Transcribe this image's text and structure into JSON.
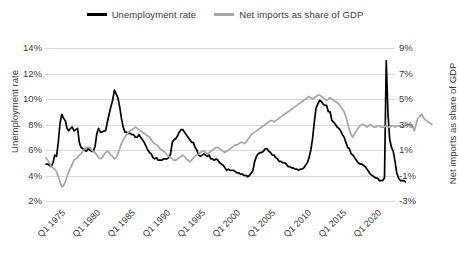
{
  "chart_data": {
    "type": "line",
    "title": "",
    "xlabel": "",
    "grid": true,
    "legend_position": "top-center",
    "axes": {
      "left": {
        "label": "Unemployment rate",
        "ticks": [
          "14%",
          "12%",
          "10%",
          "8%",
          "6%",
          "4%",
          "2%"
        ],
        "tick_values": [
          14,
          12,
          10,
          8,
          6,
          4,
          2
        ],
        "ylim": [
          2,
          14
        ]
      },
      "right": {
        "label": "Net imports as share of GDP",
        "ticks": [
          "9%",
          "7%",
          "5%",
          "3%",
          "1%",
          "-1%",
          "-3%"
        ],
        "tick_values": [
          9,
          7,
          5,
          3,
          1,
          -1,
          -3
        ],
        "ylim": [
          -3,
          9
        ]
      },
      "x": {
        "ticks": [
          "Q1 1975",
          "Q1 1980",
          "Q1 1985",
          "Q1 1990",
          "Q1 1995",
          "Q1 2000",
          "Q1 2005",
          "Q1 2010",
          "Q1 2015",
          "Q1 2020"
        ],
        "tick_years": [
          1975,
          1980,
          1985,
          1990,
          1995,
          2000,
          2005,
          2010,
          2015,
          2020
        ],
        "xlim": [
          1973.0,
          2022.75
        ]
      }
    },
    "legend": [
      {
        "name": "Unemployment rate",
        "color": "#000000",
        "axis": "left"
      },
      {
        "name": "Net imports as share of GDP",
        "color": "#a6a6a6",
        "axis": "right"
      }
    ],
    "series": [
      {
        "name": "Unemployment rate",
        "color": "#000000",
        "axis": "left",
        "width": 1.7,
        "x_start": 1973.0,
        "x_step": 0.25,
        "values": [
          4.9,
          4.9,
          4.8,
          4.7,
          5.0,
          5.6,
          5.5,
          6.6,
          8.1,
          8.8,
          8.5,
          8.3,
          7.7,
          7.5,
          7.7,
          7.8,
          7.5,
          7.6,
          7.7,
          6.6,
          6.2,
          6.1,
          6.0,
          5.9,
          6.1,
          6.0,
          5.9,
          5.9,
          6.3,
          7.3,
          7.7,
          7.4,
          7.4,
          7.5,
          7.5,
          8.2,
          8.8,
          9.4,
          9.9,
          10.7,
          10.4,
          10.1,
          9.4,
          8.5,
          7.8,
          7.4,
          7.4,
          7.3,
          7.3,
          7.2,
          7.2,
          7.0,
          7.0,
          7.2,
          7.0,
          6.8,
          6.6,
          6.3,
          6.0,
          5.8,
          5.7,
          5.4,
          5.3,
          5.4,
          5.2,
          5.2,
          5.2,
          5.3,
          5.3,
          5.3,
          5.4,
          5.7,
          6.6,
          6.8,
          6.9,
          7.1,
          7.4,
          7.6,
          7.6,
          7.4,
          7.2,
          7.0,
          6.8,
          6.6,
          6.6,
          6.2,
          6.0,
          5.6,
          5.5,
          5.6,
          5.7,
          5.6,
          5.5,
          5.6,
          5.3,
          5.3,
          5.2,
          5.3,
          5.2,
          5.0,
          4.9,
          4.8,
          4.6,
          4.4,
          4.5,
          4.4,
          4.4,
          4.4,
          4.3,
          4.2,
          4.2,
          4.1,
          4.1,
          4.0,
          4.0,
          3.9,
          4.0,
          4.2,
          4.4,
          5.1,
          5.5,
          5.7,
          5.8,
          5.8,
          5.9,
          6.1,
          6.1,
          5.9,
          5.8,
          5.6,
          5.6,
          5.4,
          5.3,
          5.1,
          5.1,
          5.0,
          5.0,
          4.9,
          4.7,
          4.7,
          4.6,
          4.6,
          4.5,
          4.5,
          4.4,
          4.5,
          4.5,
          4.6,
          4.8,
          5.0,
          5.4,
          6.0,
          6.9,
          8.2,
          9.3,
          9.6,
          9.9,
          9.8,
          9.6,
          9.5,
          9.5,
          9.0,
          9.0,
          8.3,
          8.2,
          8.0,
          7.8,
          7.7,
          7.5,
          7.2,
          7.0,
          6.6,
          6.2,
          6.1,
          5.7,
          5.6,
          5.4,
          5.2,
          5.0,
          4.9,
          4.9,
          4.8,
          4.7,
          4.5,
          4.3,
          4.1,
          4.0,
          3.9,
          3.8,
          3.8,
          3.6,
          3.6,
          3.6,
          3.8,
          13.0,
          8.8,
          6.8,
          6.2,
          5.9,
          5.1,
          4.2,
          3.8,
          3.6,
          3.6,
          3.6,
          3.5
        ]
      },
      {
        "name": "Net imports as share of GDP",
        "color": "#a6a6a6",
        "axis": "right",
        "width": 1.7,
        "x_start": 1973.0,
        "x_step": 0.25,
        "values": [
          0.4,
          0.2,
          0.0,
          -0.3,
          -0.4,
          -0.5,
          -0.7,
          -1.1,
          -1.5,
          -1.9,
          -1.8,
          -1.5,
          -1.1,
          -0.7,
          -0.4,
          -0.1,
          0.2,
          0.3,
          0.4,
          0.6,
          0.7,
          0.9,
          1.1,
          1.2,
          1.2,
          1.2,
          1.0,
          0.9,
          0.8,
          0.6,
          0.4,
          0.3,
          0.4,
          0.6,
          0.8,
          0.9,
          0.8,
          0.6,
          0.5,
          0.3,
          0.4,
          0.7,
          1.1,
          1.5,
          1.8,
          2.0,
          2.2,
          2.4,
          2.5,
          2.6,
          2.7,
          2.8,
          2.7,
          2.6,
          2.5,
          2.4,
          2.3,
          2.2,
          2.1,
          2.0,
          1.8,
          1.6,
          1.5,
          1.4,
          1.3,
          1.1,
          1.0,
          0.9,
          0.8,
          0.6,
          0.5,
          0.4,
          0.3,
          0.2,
          0.2,
          0.3,
          0.4,
          0.5,
          0.6,
          0.5,
          0.3,
          0.2,
          0.1,
          0.2,
          0.4,
          0.5,
          0.6,
          0.7,
          0.8,
          0.9,
          0.9,
          0.8,
          0.7,
          0.8,
          0.9,
          1.0,
          1.1,
          1.2,
          1.2,
          1.1,
          1.0,
          0.9,
          0.8,
          0.9,
          1.0,
          1.1,
          1.2,
          1.3,
          1.4,
          1.4,
          1.5,
          1.6,
          1.6,
          1.5,
          1.6,
          1.8,
          2.0,
          2.2,
          2.3,
          2.4,
          2.5,
          2.6,
          2.7,
          2.8,
          2.9,
          3.0,
          3.1,
          3.2,
          3.3,
          3.3,
          3.2,
          3.3,
          3.4,
          3.5,
          3.6,
          3.7,
          3.8,
          3.9,
          4.0,
          4.1,
          4.2,
          4.3,
          4.4,
          4.5,
          4.6,
          4.7,
          4.8,
          4.9,
          5.0,
          5.1,
          5.2,
          5.1,
          5.0,
          5.1,
          5.2,
          5.3,
          5.3,
          5.2,
          5.1,
          5.0,
          4.9,
          5.0,
          5.1,
          5.0,
          4.9,
          4.8,
          4.7,
          4.6,
          4.4,
          4.2,
          4.0,
          3.6,
          3.1,
          2.6,
          2.2,
          2.0,
          2.3,
          2.5,
          2.7,
          2.9,
          3.0,
          3.0,
          2.9,
          2.8,
          2.9,
          3.0,
          2.9,
          2.8,
          2.8,
          2.9,
          2.9,
          2.8,
          2.8,
          2.8,
          2.9,
          2.8,
          2.8,
          2.9,
          2.9,
          2.8,
          2.9,
          2.9,
          2.9,
          2.8,
          2.8,
          2.9,
          3.0,
          3.0,
          3.0,
          2.9,
          2.5,
          3.0,
          3.5,
          3.6,
          3.8,
          3.6,
          3.4,
          3.3,
          3.2,
          3.1,
          3.0
        ]
      }
    ]
  },
  "plot_geometry": {
    "left": 46,
    "right": 395,
    "top": 48,
    "bottom": 201
  }
}
